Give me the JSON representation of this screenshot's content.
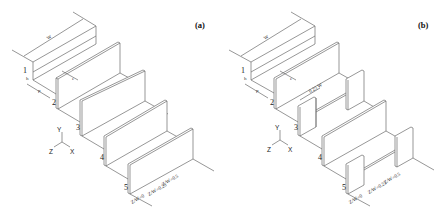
{
  "panels": [
    {
      "id": "a",
      "label": "(a)",
      "dimensions": {
        "width": "W",
        "height": "h",
        "spacing": "p",
        "thickness": "e"
      },
      "rib_labels": [
        "1",
        "2",
        "3",
        "4",
        "5"
      ],
      "axes": {
        "y": "Y",
        "z": "Z",
        "x": "X"
      },
      "planes": [
        "Z/W=0.5",
        "Z/W=0.25",
        "Z/W=0"
      ]
    },
    {
      "id": "b",
      "label": "(b)",
      "dimensions": {
        "width": "W",
        "height": "h",
        "spacing": "p",
        "thickness": "e",
        "gap": "0.25 W"
      },
      "rib_labels": [
        "1",
        "2",
        "3",
        "4",
        "5"
      ],
      "axes": {
        "y": "Y",
        "z": "Z",
        "x": "X"
      },
      "planes": [
        "Z/W=0.5",
        "Z/W=0.25",
        "Z/W=0"
      ]
    }
  ]
}
